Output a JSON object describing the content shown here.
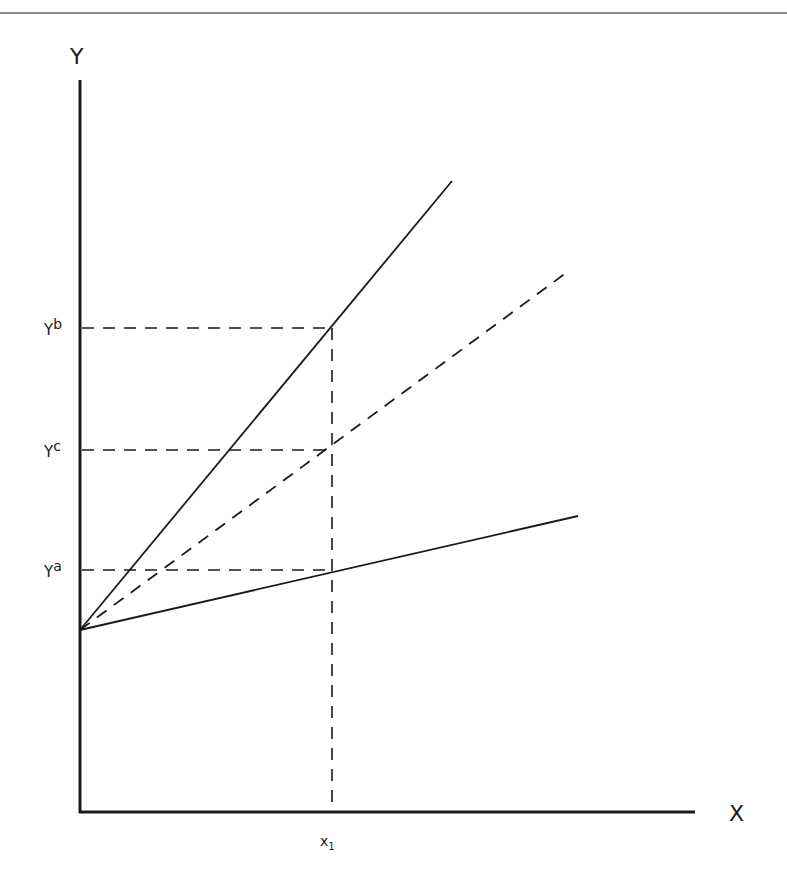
{
  "diagram": {
    "type": "line-diagram",
    "axes": {
      "y_label": "Y",
      "x_label": "X"
    },
    "y_ticks": [
      {
        "base": "Y",
        "sup": "b",
        "y": 328
      },
      {
        "base": "Y",
        "sup": "c",
        "y": 450
      },
      {
        "base": "Y",
        "sup": "a",
        "y": 570
      }
    ],
    "x_ticks": [
      {
        "base": "x",
        "sub": "1",
        "x": 332
      }
    ],
    "lines": [
      {
        "name": "steep-solid-line",
        "style": "solid",
        "from": [
          80,
          630
        ],
        "to": [
          452,
          181
        ]
      },
      {
        "name": "middle-dashed-line",
        "style": "dashed",
        "from": [
          80,
          630
        ],
        "to": [
          570,
          270
        ]
      },
      {
        "name": "shallow-solid-line",
        "style": "solid",
        "from": [
          80,
          630
        ],
        "to": [
          578,
          516
        ]
      }
    ],
    "colors": {
      "line": "#1a1a1a",
      "top_rule": "#8c8c8c",
      "background": "#ffffff"
    }
  }
}
